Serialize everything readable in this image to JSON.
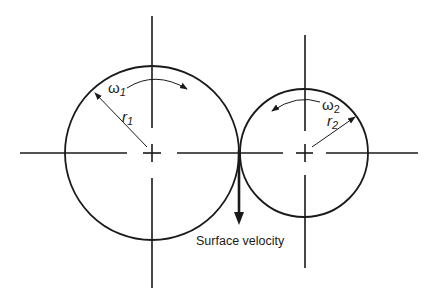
{
  "diagram": {
    "circle1": {
      "omega_symbol": "ω",
      "omega_sub": "1",
      "radius_symbol": "r",
      "radius_sub": "1",
      "rotation": "clockwise"
    },
    "circle2": {
      "omega_symbol": "ω",
      "omega_sub": "2",
      "radius_symbol": "r",
      "radius_sub": "2",
      "rotation": "counterclockwise"
    },
    "contact_label": "Surface velocity",
    "stroke_color": "#1a1a1a"
  }
}
